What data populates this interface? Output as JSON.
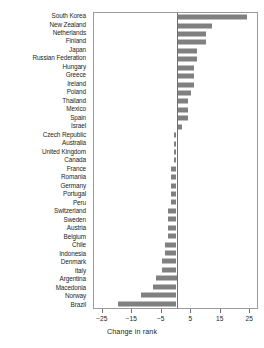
{
  "chart_data": {
    "type": "bar",
    "orientation": "horizontal",
    "title": "",
    "xlabel": "Change in rank",
    "ylabel": "",
    "xlim": [
      -28,
      28
    ],
    "xticks": [
      -25,
      -15,
      -5,
      5,
      15,
      25
    ],
    "xticklabels": [
      "-25",
      "-15",
      "-5",
      "5",
      "15",
      "25"
    ],
    "grid": false,
    "legend": null,
    "bar_color": "#808080",
    "frame_color": "#9a9a9a",
    "zero_line": 0,
    "categories": [
      "South Korea",
      "New Zealand",
      "Netherlands",
      "Finland",
      "Japan",
      "Russian Federation",
      "Hungary",
      "Greece",
      "Ireland",
      "Poland",
      "Thailand",
      "Mexico",
      "Spain",
      "Israel",
      "Czech Republic",
      "Australia",
      "United Kingdom",
      "Canada",
      "France",
      "Romania",
      "Germany",
      "Portugal",
      "Peru",
      "Switzerland",
      "Sweden",
      "Austria",
      "Belgium",
      "Chile",
      "Indonesia",
      "Denmark",
      "Italy",
      "Argentina",
      "Macedonia",
      "Norway",
      "Brazil"
    ],
    "values": [
      24,
      12,
      10,
      10,
      7,
      7,
      6,
      6,
      6,
      5,
      4,
      4,
      4,
      2,
      -1,
      -1,
      -1,
      -1,
      -2,
      -2,
      -2,
      -2,
      -2,
      -3,
      -3,
      -3,
      -3,
      -4,
      -4,
      -5,
      -5,
      -7,
      -8,
      -12,
      -20
    ]
  },
  "axis": {
    "xlabel": "Change in rank"
  }
}
